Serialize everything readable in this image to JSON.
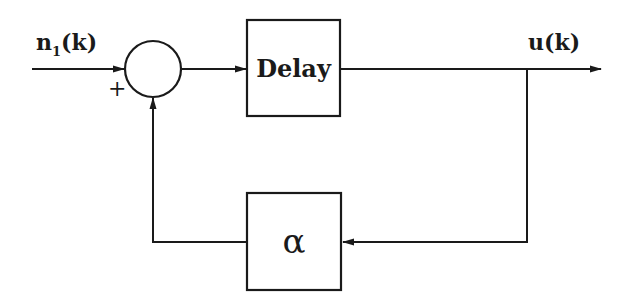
{
  "diagram": {
    "type": "block-diagram",
    "signals": {
      "input": {
        "base": "n",
        "subscript": "1",
        "arg": "(k)"
      },
      "output": {
        "text": "u(k)"
      }
    },
    "summing_junction": {
      "input_sign": "+"
    },
    "blocks": {
      "delay": {
        "label": "Delay"
      },
      "gain": {
        "label": "α"
      }
    },
    "connections": [
      {
        "from": "input n1(k)",
        "to": "summing_junction",
        "sign": "+"
      },
      {
        "from": "summing_junction",
        "to": "delay"
      },
      {
        "from": "delay",
        "to": "output u(k)"
      },
      {
        "from": "output u(k)",
        "to": "gain α"
      },
      {
        "from": "gain α",
        "to": "summing_junction"
      }
    ],
    "colors": {
      "line": "#1a1a1a",
      "background": "#ffffff"
    }
  }
}
